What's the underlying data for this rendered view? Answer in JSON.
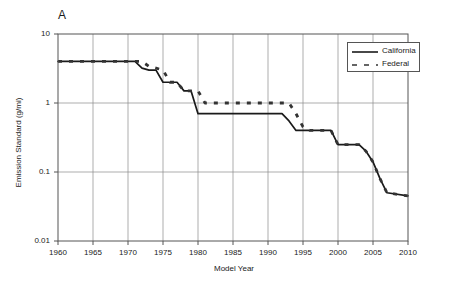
{
  "panel": {
    "label": "A"
  },
  "chart_data": {
    "type": "line",
    "title": "",
    "subtitle": "",
    "xlabel": "Model Year",
    "ylabel": "Emission Standard (g/mi)",
    "xlim": [
      1960,
      2010
    ],
    "ylim": [
      0.01,
      10
    ],
    "yscale": "log",
    "xscale": "linear",
    "grid": true,
    "grid_x_ticks": [
      1960,
      1965,
      1970,
      1975,
      1980,
      1985,
      1990,
      1995,
      2000,
      2005,
      2010
    ],
    "grid_y_ticks": [
      0.01,
      0.1,
      1,
      10
    ],
    "xticklabels": [
      "1960",
      "1965",
      "1970",
      "1975",
      "1980",
      "1985",
      "1990",
      "1995",
      "2000",
      "2005",
      "2010"
    ],
    "yticklabels": [
      "0.01",
      "0.1",
      "1",
      "10"
    ],
    "legend_position": "top-right",
    "series": [
      {
        "name": "California",
        "style": "solid",
        "color": "#1a1a1a",
        "x": [
          1960,
          1971,
          1972,
          1973,
          1974,
          1975,
          1977,
          1978,
          1979,
          1980,
          1981,
          1992,
          1993,
          1994,
          1999,
          2000,
          2003,
          2004,
          2005,
          2006,
          2007,
          2010
        ],
        "y": [
          4.0,
          4.0,
          3.2,
          3.0,
          3.0,
          2.0,
          2.0,
          1.5,
          1.5,
          0.7,
          0.7,
          0.7,
          0.55,
          0.4,
          0.4,
          0.25,
          0.25,
          0.2,
          0.14,
          0.08,
          0.05,
          0.045
        ]
      },
      {
        "name": "Federal",
        "style": "dashed",
        "color": "#333333",
        "x": [
          1960,
          1972,
          1973,
          1974,
          1975,
          1976,
          1977,
          1978,
          1980,
          1981,
          1993,
          1994,
          1995,
          1996,
          1999,
          2000,
          2003,
          2004,
          2005,
          2006,
          2007,
          2010
        ],
        "y": [
          4.0,
          4.0,
          3.4,
          3.2,
          3.0,
          2.0,
          2.0,
          1.5,
          1.5,
          1.0,
          1.0,
          0.7,
          0.45,
          0.4,
          0.4,
          0.25,
          0.25,
          0.2,
          0.14,
          0.08,
          0.05,
          0.045
        ]
      }
    ],
    "legend": [
      {
        "label": "California",
        "style": "solid"
      },
      {
        "label": "Federal",
        "style": "dashed"
      }
    ]
  }
}
